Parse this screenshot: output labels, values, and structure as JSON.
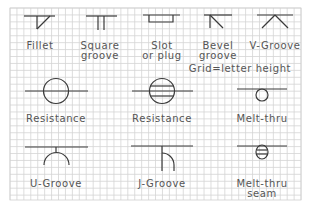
{
  "grid_note": "Grid=letter height",
  "colors": {
    "background": "#ffffff",
    "grid": "#d0d0d0",
    "stroke": "#333333",
    "text": "#555555"
  },
  "symbols": [
    {
      "name": "fillet",
      "label": [
        "Fillet"
      ]
    },
    {
      "name": "square-groove",
      "label": [
        "Square",
        "groove"
      ]
    },
    {
      "name": "slot-or-plug",
      "label": [
        "Slot",
        "or plug"
      ]
    },
    {
      "name": "bevel-groove",
      "label": [
        "Bevel",
        "groove"
      ]
    },
    {
      "name": "v-groove",
      "label": [
        "V-Groove"
      ]
    },
    {
      "name": "resistance-spot",
      "label": [
        "Resistance"
      ]
    },
    {
      "name": "resistance-seam",
      "label": [
        "Resistance"
      ]
    },
    {
      "name": "melt-thru",
      "label": [
        "Melt-thru"
      ]
    },
    {
      "name": "u-groove",
      "label": [
        "U-Groove"
      ]
    },
    {
      "name": "j-groove",
      "label": [
        "J-Groove"
      ]
    },
    {
      "name": "melt-thru-seam",
      "label": [
        "Melt-thru",
        "seam"
      ]
    }
  ]
}
